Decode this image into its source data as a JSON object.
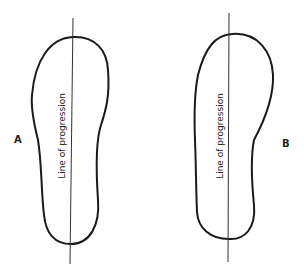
{
  "figures": [
    {
      "label": "A",
      "line_text": "Line of progression"
    },
    {
      "label": "B",
      "line_text": "Line of progression"
    }
  ],
  "colors": {
    "outline": "#1a1a1a",
    "line": "#333333"
  }
}
